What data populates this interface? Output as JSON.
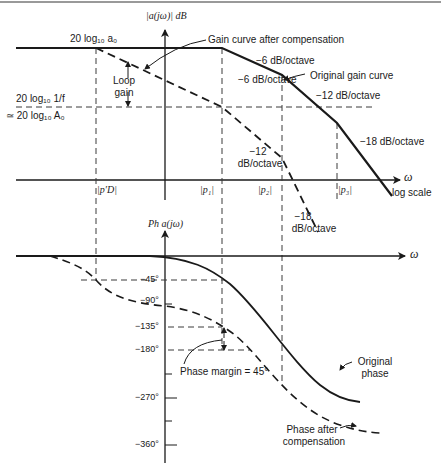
{
  "figure": {
    "type": "bode-plot",
    "magnitude": {
      "axis_label": "|a(jω)| dB",
      "x_axis_label": "ω",
      "x_scale_label": "log scale",
      "dc_gain_label": "20 log₁₀ a₀",
      "feedback_level_label_line1": "20 log₁₀ 1/f",
      "feedback_level_label_line2": "≃ 20 log₁₀ A₀",
      "loop_gain_label": [
        "Loop",
        "gain"
      ],
      "annotations": {
        "gain_after_comp": "Gain curve after compensation",
        "original_gain": "Original gain curve",
        "orig_slope_1": "−6 dB/octave",
        "orig_slope_2": "−12 dB/octave",
        "orig_slope_3": "−18 dB/octave",
        "comp_slope_1": "−6 dB/octave",
        "comp_slope_2_line1": "−12",
        "comp_slope_2_line2": "dB/octave",
        "comp_slope_3_line1": "−18",
        "comp_slope_3_line2": "dB/octave"
      },
      "poles": [
        "|p′D|",
        "|p₁|",
        "|p₂|",
        "|p₃|"
      ]
    },
    "phase": {
      "axis_label": "Ph a(jω)",
      "x_axis_label": "ω",
      "ticks": [
        "−45°",
        "−90°",
        "−135°",
        "−180°",
        "−270°",
        "−360°"
      ],
      "phase_margin_label": "Phase margin = 45°",
      "original_phase_label": [
        "Original",
        "phase"
      ],
      "phase_after_comp_label": [
        "Phase after",
        "compensation"
      ]
    },
    "colors": {
      "ink": "#1a1a1a",
      "dash": "#3a3a3a",
      "background": "#ffffff"
    }
  }
}
